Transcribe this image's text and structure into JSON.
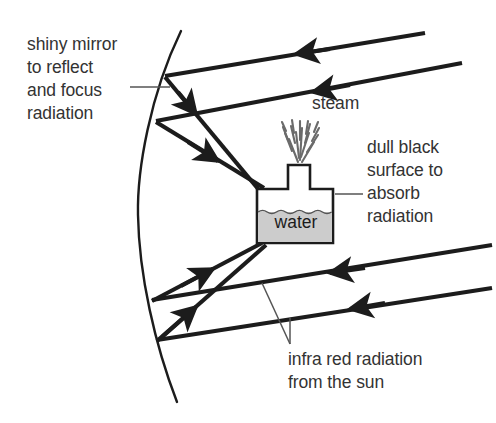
{
  "diagram": {
    "labels": {
      "mirror": "shiny mirror\nto reflect\nand focus\nradiation",
      "steam": "steam",
      "absorber": "dull black\nsurface to\nabsorb\nradiation",
      "incoming": "infra red radiation\nfrom the sun",
      "water": "water"
    },
    "colors": {
      "stroke": "#1c1c1c",
      "text": "#333333",
      "water_fill": "#cccccc",
      "vessel_fill": "#ffffff",
      "background": "#ffffff",
      "leader": "#555555"
    },
    "elements": {
      "mirror_name": "parabolic mirror arc",
      "vessel_name": "water boiler vessel",
      "spout_name": "steam spout",
      "ray_count_incoming": 4,
      "ray_count_reflected": 4
    }
  }
}
